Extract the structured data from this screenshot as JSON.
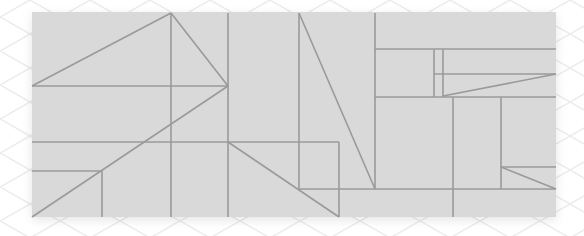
{
  "canvas": {
    "width": 584,
    "height": 236
  },
  "colors": {
    "background": "#ffffff",
    "pattern": "#ececec",
    "panel": "#d9d9d9",
    "line": "#9a9a9a"
  },
  "panel": {
    "x": 32,
    "y": 12,
    "width": 524,
    "height": 205
  },
  "lines": [
    {
      "x1": 32,
      "y1": 86,
      "x2": 228,
      "y2": 86
    },
    {
      "x1": 32,
      "y1": 86,
      "x2": 171,
      "y2": 13
    },
    {
      "x1": 171,
      "y1": 13,
      "x2": 228,
      "y2": 86
    },
    {
      "x1": 171,
      "y1": 13,
      "x2": 171,
      "y2": 217
    },
    {
      "x1": 228,
      "y1": 13,
      "x2": 228,
      "y2": 217
    },
    {
      "x1": 32,
      "y1": 217,
      "x2": 228,
      "y2": 86
    },
    {
      "x1": 32,
      "y1": 142,
      "x2": 339,
      "y2": 142
    },
    {
      "x1": 32,
      "y1": 171,
      "x2": 102,
      "y2": 171
    },
    {
      "x1": 102,
      "y1": 171,
      "x2": 102,
      "y2": 217
    },
    {
      "x1": 228,
      "y1": 142,
      "x2": 339,
      "y2": 217
    },
    {
      "x1": 339,
      "y1": 142,
      "x2": 339,
      "y2": 217
    },
    {
      "x1": 299,
      "y1": 13,
      "x2": 299,
      "y2": 189
    },
    {
      "x1": 299,
      "y1": 13,
      "x2": 375,
      "y2": 189
    },
    {
      "x1": 375,
      "y1": 13,
      "x2": 375,
      "y2": 189
    },
    {
      "x1": 299,
      "y1": 189,
      "x2": 556,
      "y2": 189
    },
    {
      "x1": 375,
      "y1": 49,
      "x2": 556,
      "y2": 49
    },
    {
      "x1": 375,
      "y1": 97,
      "x2": 556,
      "y2": 97
    },
    {
      "x1": 434,
      "y1": 49,
      "x2": 434,
      "y2": 97
    },
    {
      "x1": 443,
      "y1": 49,
      "x2": 443,
      "y2": 97
    },
    {
      "x1": 434,
      "y1": 74,
      "x2": 556,
      "y2": 74
    },
    {
      "x1": 443,
      "y1": 96,
      "x2": 556,
      "y2": 74
    },
    {
      "x1": 453,
      "y1": 97,
      "x2": 453,
      "y2": 217
    },
    {
      "x1": 501,
      "y1": 97,
      "x2": 501,
      "y2": 189
    },
    {
      "x1": 501,
      "y1": 167,
      "x2": 556,
      "y2": 167
    },
    {
      "x1": 501,
      "y1": 167,
      "x2": 556,
      "y2": 189
    }
  ]
}
